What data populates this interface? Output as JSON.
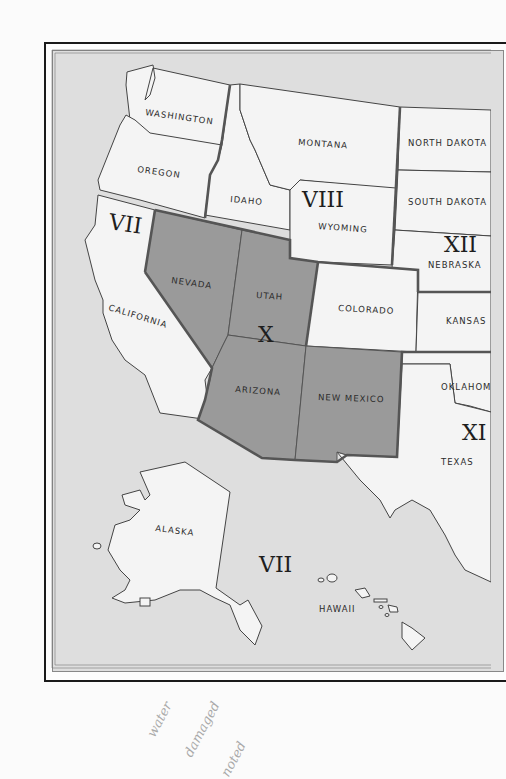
{
  "map": {
    "title": "",
    "colors": {
      "ocean": "#dedede",
      "land": "#f4f4f4",
      "region_x_fill": "#9a9a9a",
      "border_thick": "#555555",
      "border_thin": "#555555"
    },
    "states": {
      "washington": "WASHINGTON",
      "oregon": "OREGON",
      "california": "CALIFORNIA",
      "idaho": "IDAHO",
      "montana": "MONTANA",
      "wyoming": "WYOMING",
      "nevada": "NEVADA",
      "utah": "UTAH",
      "colorado": "COLORADO",
      "arizona": "ARIZONA",
      "new_mexico": "NEW MEXICO",
      "north_dakota": "NORTH DAKOTA",
      "south_dakota": "SOUTH DAKOTA",
      "nebraska": "NEBRASKA",
      "kansas": "KANSAS",
      "oklahoma": "OKLAHOM",
      "texas": "TEXAS",
      "alaska": "ALASKA",
      "hawaii": "HAWAII"
    },
    "regions": {
      "vii_mainland": "VII",
      "vii_pacific": "VII",
      "viii": "VIII",
      "x": "X",
      "xi": "XI",
      "xii": "XII"
    },
    "highlighted_region": "X"
  },
  "annotation": {
    "handwritten_note_lines": [
      "water",
      "damaged",
      "noted"
    ]
  }
}
